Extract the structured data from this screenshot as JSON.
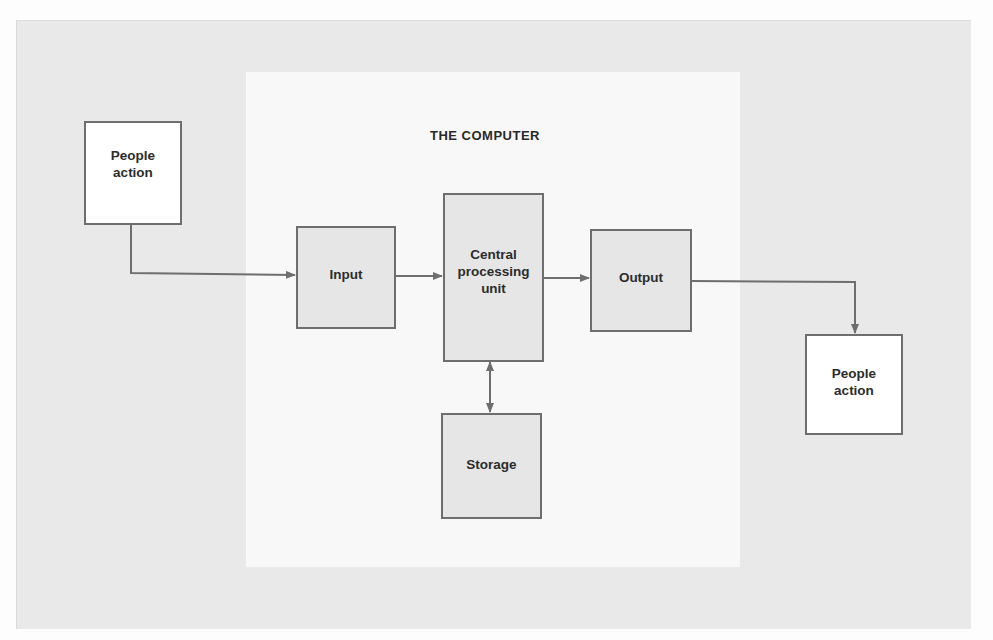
{
  "diagram": {
    "title": "THE COMPUTER",
    "nodes": {
      "people_in": {
        "label": "People\naction"
      },
      "input": {
        "label": "Input"
      },
      "cpu": {
        "label": "Central\nprocessing\nunit"
      },
      "output": {
        "label": "Output"
      },
      "storage": {
        "label": "Storage"
      },
      "people_out": {
        "label": "People\naction"
      }
    },
    "edges": [
      {
        "from": "people_in",
        "to": "input",
        "type": "arrow"
      },
      {
        "from": "input",
        "to": "cpu",
        "type": "arrow"
      },
      {
        "from": "cpu",
        "to": "output",
        "type": "arrow"
      },
      {
        "from": "cpu",
        "to": "storage",
        "type": "bidirectional"
      },
      {
        "from": "output",
        "to": "people_out",
        "type": "arrow"
      }
    ],
    "colors": {
      "line": "#6e6e6e",
      "outer_panel": "#e9e9e9",
      "inner_panel": "#f8f8f8",
      "box_fill": "#e6e6e6"
    }
  }
}
